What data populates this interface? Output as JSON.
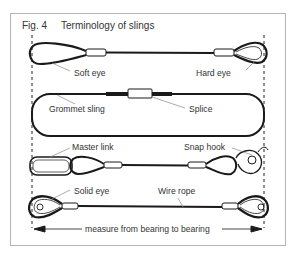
{
  "figure": {
    "number": "Fig. 4",
    "title": "Terminology of slings"
  },
  "labels": {
    "soft_eye": "Soft eye",
    "hard_eye": "Hard eye",
    "grommet_sling": "Grommet sling",
    "splice": "Splice",
    "master_link": "Master link",
    "snap_hook": "Snap hook",
    "solid_eye": "Solid eye",
    "wire_rope": "Wire rope",
    "measure": "measure from bearing to bearing"
  },
  "colors": {
    "line": "#1a1a1a",
    "text": "#333333",
    "frame": "#b5b5b5",
    "leader": "#8a8a8a"
  }
}
